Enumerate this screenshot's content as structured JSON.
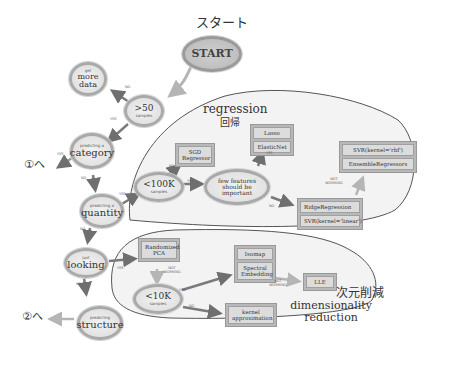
{
  "title_jp": "スタート",
  "nodes": {
    "start": "START",
    "samples_gt50": {
      "main": ">50",
      "sub": "samples"
    },
    "more_data": {
      "sub": "get",
      "main": "more data"
    },
    "category": {
      "sub": "predicting a",
      "main": "category"
    },
    "quantity": {
      "sub": "predicting a",
      "main": "quantity"
    },
    "looking": {
      "sub": "just",
      "main": "looking"
    },
    "structure": {
      "sub": "predicting",
      "main": "structure"
    },
    "lt100k": {
      "main": "<100K",
      "sub": "samples"
    },
    "few_features": "few features should be important",
    "lt10k": {
      "main": "<10K",
      "sub": "samples"
    }
  },
  "boxes": {
    "sgd": [
      "SGD Regressor"
    ],
    "lasso": [
      "Lasso",
      "ElasticNet"
    ],
    "svr_rbf": [
      "SVR(kernel='rbf')",
      "EnsembleRegressors"
    ],
    "ridge": [
      "RidgeRegression",
      "SVR(kernel='linear')"
    ],
    "pca": [
      "Randomized PCA"
    ],
    "isomap": [
      "Isomap",
      "Spectral Embedding"
    ],
    "lle": [
      "LLE"
    ],
    "kernel": [
      "kernel approximation"
    ]
  },
  "edge_labels": {
    "yes": "YES",
    "no": "NO",
    "not_working": "NOT WORKING"
  },
  "exits": {
    "to1": "①へ",
    "to2": "②へ"
  },
  "regions": {
    "regression": {
      "en": "regression",
      "jp": "回帰"
    },
    "dimred": {
      "jp": "次元削減",
      "en": "dimensionality reduction"
    }
  },
  "colors": {
    "arrow": "#7a7a7a",
    "arrow_light": "#b5b5b5",
    "node_border": "#a9a9a9",
    "box_fill": "#b8b8b8",
    "region_fill": "#f3f3f3",
    "region_border": "#555555"
  }
}
